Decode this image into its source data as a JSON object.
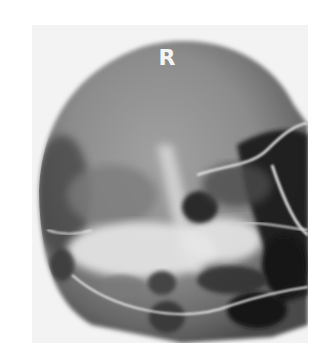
{
  "image": {
    "kind": "radiograph",
    "subject": "skull x-ray",
    "side_marker": "R",
    "colors": {
      "background": "#ffffff",
      "film_light": "#f3f3f3",
      "skull_mid": "#8a8a8a",
      "skull_dark": "#1c1c1c",
      "bone_bright": "#e6e6e6"
    }
  }
}
